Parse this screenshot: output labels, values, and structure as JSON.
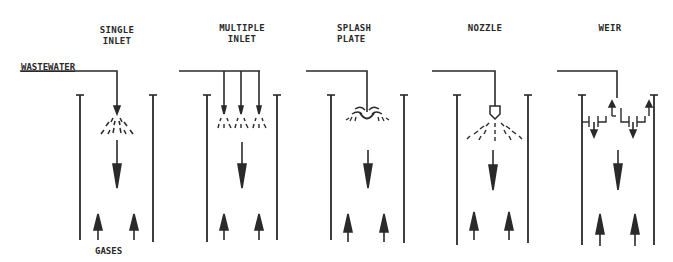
{
  "diagram": {
    "inlet_label": "WASTEWATER",
    "outlet_label": "GASES",
    "colors": {
      "ink": "#2a2a2a",
      "background": "#ffffff"
    },
    "panels": [
      {
        "id": "single-inlet",
        "title_line1": "SINGLE",
        "title_line2": "INLET",
        "distributor": "single spray pipe"
      },
      {
        "id": "multiple-inlet",
        "title_line1": "MULTIPLE",
        "title_line2": "INLET",
        "distributor": "three spray pipes"
      },
      {
        "id": "splash-plate",
        "title_line1": "SPLASH",
        "title_line2": "PLATE",
        "distributor": "splash plate"
      },
      {
        "id": "nozzle",
        "title_line1": "NOZZLE",
        "title_line2": "",
        "distributor": "spray nozzle"
      },
      {
        "id": "weir",
        "title_line1": "WEIR",
        "title_line2": "",
        "distributor": "overflow weir trough"
      }
    ]
  }
}
